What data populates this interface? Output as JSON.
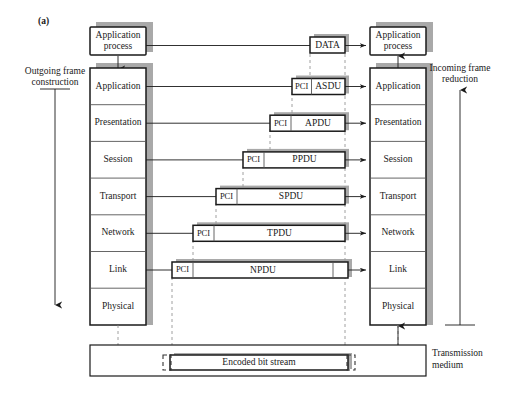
{
  "figure": {
    "tag": "(a)"
  },
  "left_side": {
    "label_line1": "Outgoing frame",
    "label_line2": "construction",
    "arrow_direction": "down"
  },
  "right_side": {
    "label_line1": "Incoming frame",
    "label_line2": "reduction",
    "arrow_direction": "up"
  },
  "source_stack": {
    "process_label_line1": "Application",
    "process_label_line2": "process",
    "layers": [
      "Application",
      "Presentation",
      "Session",
      "Transport",
      "Network",
      "Link",
      "Physical"
    ]
  },
  "destination_stack": {
    "process_label_line1": "Application",
    "process_label_line2": "process",
    "layers": [
      "Application",
      "Presentation",
      "Session",
      "Transport",
      "Network",
      "Link",
      "Physical"
    ]
  },
  "pdus": [
    {
      "pci": "",
      "name": "DATA",
      "has_pci": false
    },
    {
      "pci": "PCI",
      "name": "ASDU",
      "has_pci": true
    },
    {
      "pci": "PCI",
      "name": "APDU",
      "has_pci": true
    },
    {
      "pci": "PCI",
      "name": "PPDU",
      "has_pci": true
    },
    {
      "pci": "PCI",
      "name": "SPDU",
      "has_pci": true
    },
    {
      "pci": "PCI",
      "name": "TPDU",
      "has_pci": true
    },
    {
      "pci": "PCI",
      "name": "NPDU",
      "has_pci": true
    }
  ],
  "medium": {
    "bit_stream_label": "Encoded bit stream",
    "label_line1": "Transmission",
    "label_line2": "medium"
  },
  "colors": {
    "stroke": "#1a1a1a",
    "shadow": "#9a9a9a",
    "dash": "#888888",
    "background": "#ffffff"
  }
}
